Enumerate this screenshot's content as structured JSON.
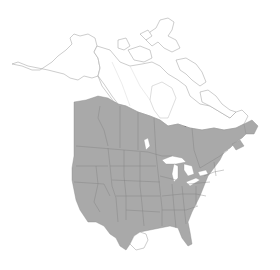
{
  "map": {
    "type": "range-distribution-map",
    "region": "North America",
    "colors": {
      "background": "#ffffff",
      "range_fill": "#a9a9a9",
      "range_border": "#7e7e7e",
      "outside_range_fill": "#ffffff",
      "outline": "#9a9a9a"
    },
    "regions": [
      {
        "name": "Alaska",
        "in_range": false
      },
      {
        "name": "Yukon",
        "in_range": false
      },
      {
        "name": "Northwest Territories",
        "in_range": false
      },
      {
        "name": "Nunavut",
        "in_range": false
      },
      {
        "name": "Canadian Arctic Archipelago",
        "in_range": false
      },
      {
        "name": "Northern Quebec / Labrador",
        "in_range": false
      },
      {
        "name": "Southern British Columbia",
        "in_range": true
      },
      {
        "name": "Southern Alberta",
        "in_range": true
      },
      {
        "name": "Southern Saskatchewan",
        "in_range": true
      },
      {
        "name": "Southern Manitoba",
        "in_range": true
      },
      {
        "name": "Southern Ontario",
        "in_range": true
      },
      {
        "name": "Southern Quebec",
        "in_range": true
      },
      {
        "name": "Maritime Provinces",
        "in_range": true
      },
      {
        "name": "Newfoundland",
        "in_range": true
      },
      {
        "name": "Contiguous United States",
        "in_range": true
      },
      {
        "name": "Southern tip of Texas",
        "in_range": false
      }
    ]
  }
}
